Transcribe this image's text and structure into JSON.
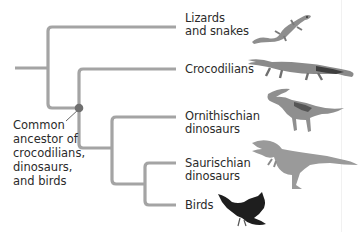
{
  "diagram": {
    "type": "phylogenetic-tree",
    "colors": {
      "branch": "#a4a4a4",
      "node": "#6f6f6f",
      "text": "#2b2b2b",
      "pointer": "#555555"
    },
    "taxa": [
      {
        "label": "Lizards\nand snakes",
        "animal": "lizard"
      },
      {
        "label": "Crocodilians",
        "animal": "crocodile"
      },
      {
        "label": "Ornithischian\ndinosaurs",
        "animal": "parasaurolophus"
      },
      {
        "label": "Saurischian\ndinosaurs",
        "animal": "theropod"
      },
      {
        "label": "Birds",
        "animal": "bird"
      }
    ],
    "node_annotation": {
      "label": "Common\nancestor of\ncrocodilians,\ndinosaurs,\nand birds"
    }
  }
}
